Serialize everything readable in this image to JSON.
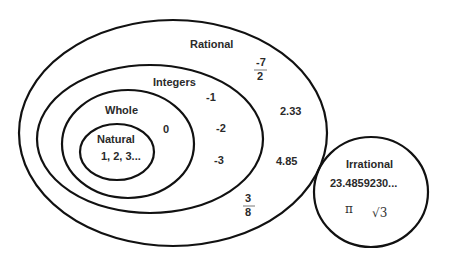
{
  "diagram": {
    "stroke_color": "#111111",
    "text_color": "#2a2a2a",
    "sets": {
      "rational": {
        "label": "Rational",
        "examples": {
          "neg_seven_halves": {
            "numerator": "-7",
            "denominator": "2"
          },
          "two_point_three_three": "2.33",
          "four_point_eight_five": "4.85",
          "three_eighths": {
            "numerator": "3",
            "denominator": "8"
          }
        }
      },
      "integers": {
        "label": "Integers",
        "examples": [
          "-1",
          "-2",
          "-3"
        ]
      },
      "whole": {
        "label": "Whole",
        "examples": [
          "0"
        ]
      },
      "natural": {
        "label": "Natural",
        "examples_text": "1, 2, 3..."
      },
      "irrational": {
        "label": "Irrational",
        "examples": {
          "decimal": "23.4859230...",
          "pi": "π",
          "sqrt_three": "√3"
        }
      }
    }
  }
}
